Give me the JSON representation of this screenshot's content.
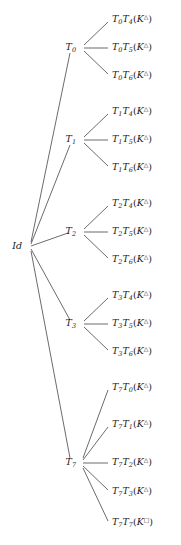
{
  "figure": {
    "type": "tree-diagram",
    "width": 181,
    "height": 545,
    "background_color": "#ffffff",
    "line_color": "#2b2b2b",
    "text_color": "#1a1a1a"
  },
  "root": {
    "id": "root",
    "label": "Id",
    "label_text": "Id",
    "x": 22,
    "y": 246
  },
  "internal_nodes": [
    {
      "id": "T0",
      "base": "T",
      "subscript": "0",
      "label_text": "T0",
      "x": 76,
      "y": 48
    },
    {
      "id": "T1",
      "base": "T",
      "subscript": "1",
      "label_text": "T1",
      "x": 76,
      "y": 140
    },
    {
      "id": "T2",
      "base": "T",
      "subscript": "2",
      "label_text": "T2",
      "x": 76,
      "y": 232
    },
    {
      "id": "T3",
      "base": "T",
      "subscript": "3",
      "label_text": "T3",
      "x": 76,
      "y": 324
    },
    {
      "id": "T7",
      "base": "T",
      "subscript": "7",
      "label_text": "T7",
      "x": 76,
      "y": 463
    }
  ],
  "leaves": [
    {
      "id": "T0T4",
      "first": "T",
      "first_sub": "0",
      "second": "T",
      "second_sub": "4",
      "k_sup": "△",
      "label_text": "T0T4(K△)",
      "parent": "T0",
      "x": 112,
      "y": 20
    },
    {
      "id": "T0T5",
      "first": "T",
      "first_sub": "0",
      "second": "T",
      "second_sub": "5",
      "k_sup": "△",
      "label_text": "T0T5(K△)",
      "parent": "T0",
      "x": 112,
      "y": 48
    },
    {
      "id": "T0T6",
      "first": "T",
      "first_sub": "0",
      "second": "T",
      "second_sub": "6",
      "k_sup": "△",
      "label_text": "T0T6(K△)",
      "parent": "T0",
      "x": 112,
      "y": 76
    },
    {
      "id": "T1T4",
      "first": "T",
      "first_sub": "1",
      "second": "T",
      "second_sub": "4",
      "k_sup": "△",
      "label_text": "T1T4(K△)",
      "parent": "T1",
      "x": 112,
      "y": 112
    },
    {
      "id": "T1T5",
      "first": "T",
      "first_sub": "1",
      "second": "T",
      "second_sub": "5",
      "k_sup": "△",
      "label_text": "T1T5(K△)",
      "parent": "T1",
      "x": 112,
      "y": 140
    },
    {
      "id": "T1T6",
      "first": "T",
      "first_sub": "1",
      "second": "T",
      "second_sub": "6",
      "k_sup": "△",
      "label_text": "T1T6(K△)",
      "parent": "T1",
      "x": 112,
      "y": 168
    },
    {
      "id": "T2T4",
      "first": "T",
      "first_sub": "2",
      "second": "T",
      "second_sub": "4",
      "k_sup": "△",
      "label_text": "T2T4(K△)",
      "parent": "T2",
      "x": 112,
      "y": 204
    },
    {
      "id": "T2T5",
      "first": "T",
      "first_sub": "2",
      "second": "T",
      "second_sub": "5",
      "k_sup": "△",
      "label_text": "T2T5(K△)",
      "parent": "T2",
      "x": 112,
      "y": 232
    },
    {
      "id": "T2T6",
      "first": "T",
      "first_sub": "2",
      "second": "T",
      "second_sub": "6",
      "k_sup": "△",
      "label_text": "T2T6(K△)",
      "parent": "T2",
      "x": 112,
      "y": 260
    },
    {
      "id": "T3T4",
      "first": "T",
      "first_sub": "3",
      "second": "T",
      "second_sub": "4",
      "k_sup": "△",
      "label_text": "T3T4(K△)",
      "parent": "T3",
      "x": 112,
      "y": 296
    },
    {
      "id": "T3T5",
      "first": "T",
      "first_sub": "3",
      "second": "T",
      "second_sub": "5",
      "k_sup": "△",
      "label_text": "T3T5(K△)",
      "parent": "T3",
      "x": 112,
      "y": 324
    },
    {
      "id": "T3T6",
      "first": "T",
      "first_sub": "3",
      "second": "T",
      "second_sub": "6",
      "k_sup": "△",
      "label_text": "T3T6(K△)",
      "parent": "T3",
      "x": 112,
      "y": 352
    },
    {
      "id": "T7T0",
      "first": "T",
      "first_sub": "7",
      "second": "T",
      "second_sub": "0",
      "k_sup": "△",
      "label_text": "T7T0(K△)",
      "parent": "T7",
      "x": 112,
      "y": 388
    },
    {
      "id": "T7T1",
      "first": "T",
      "first_sub": "7",
      "second": "T",
      "second_sub": "1",
      "k_sup": "△",
      "label_text": "T7T1(K△)",
      "parent": "T7",
      "x": 112,
      "y": 425
    },
    {
      "id": "T7T2",
      "first": "T",
      "first_sub": "7",
      "second": "T",
      "second_sub": "2",
      "k_sup": "△",
      "label_text": "T7T2(K△)",
      "parent": "T7",
      "x": 112,
      "y": 463
    },
    {
      "id": "T7T3",
      "first": "T",
      "first_sub": "7",
      "second": "T",
      "second_sub": "3",
      "k_sup": "△",
      "label_text": "T7T3(K△)",
      "parent": "T7",
      "x": 112,
      "y": 492
    },
    {
      "id": "T7T7",
      "first": "T",
      "first_sub": "7",
      "second": "T",
      "second_sub": "7",
      "k_sup": "□",
      "label_text": "T7T7(K□)",
      "parent": "T7",
      "x": 112,
      "y": 523
    }
  ],
  "edges": [
    {
      "id": "edge-root-T0",
      "from": "root",
      "to": "T0",
      "x1": 31,
      "y1": 242,
      "x2": 70,
      "y2": 53
    },
    {
      "id": "edge-root-T1",
      "from": "root",
      "to": "T1",
      "x1": 31,
      "y1": 244,
      "x2": 70,
      "y2": 145
    },
    {
      "id": "edge-root-T2",
      "from": "root",
      "to": "T2",
      "x1": 31,
      "y1": 246,
      "x2": 68,
      "y2": 233
    },
    {
      "id": "edge-root-T3",
      "from": "root",
      "to": "T3",
      "x1": 31,
      "y1": 249,
      "x2": 70,
      "y2": 320
    },
    {
      "id": "edge-root-T7",
      "from": "root",
      "to": "T7",
      "x1": 31,
      "y1": 251,
      "x2": 70,
      "y2": 458
    },
    {
      "id": "edge-T0-T0T4",
      "from": "T0",
      "to": "T0T4",
      "x1": 84,
      "y1": 45,
      "x2": 108,
      "y2": 22
    },
    {
      "id": "edge-T0-T0T5",
      "from": "T0",
      "to": "T0T5",
      "x1": 84,
      "y1": 48,
      "x2": 108,
      "y2": 48
    },
    {
      "id": "edge-T0-T0T6",
      "from": "T0",
      "to": "T0T6",
      "x1": 84,
      "y1": 51,
      "x2": 108,
      "y2": 74
    },
    {
      "id": "edge-T1-T1T4",
      "from": "T1",
      "to": "T1T4",
      "x1": 84,
      "y1": 137,
      "x2": 108,
      "y2": 114
    },
    {
      "id": "edge-T1-T1T5",
      "from": "T1",
      "to": "T1T5",
      "x1": 84,
      "y1": 140,
      "x2": 108,
      "y2": 140
    },
    {
      "id": "edge-T1-T1T6",
      "from": "T1",
      "to": "T1T6",
      "x1": 84,
      "y1": 143,
      "x2": 108,
      "y2": 166
    },
    {
      "id": "edge-T2-T2T4",
      "from": "T2",
      "to": "T2T4",
      "x1": 84,
      "y1": 229,
      "x2": 108,
      "y2": 206
    },
    {
      "id": "edge-T2-T2T5",
      "from": "T2",
      "to": "T2T5",
      "x1": 84,
      "y1": 232,
      "x2": 108,
      "y2": 232
    },
    {
      "id": "edge-T2-T2T6",
      "from": "T2",
      "to": "T2T6",
      "x1": 84,
      "y1": 235,
      "x2": 108,
      "y2": 258
    },
    {
      "id": "edge-T3-T3T4",
      "from": "T3",
      "to": "T3T4",
      "x1": 84,
      "y1": 321,
      "x2": 108,
      "y2": 298
    },
    {
      "id": "edge-T3-T3T5",
      "from": "T3",
      "to": "T3T5",
      "x1": 84,
      "y1": 324,
      "x2": 108,
      "y2": 324
    },
    {
      "id": "edge-T3-T3T6",
      "from": "T3",
      "to": "T3T6",
      "x1": 84,
      "y1": 327,
      "x2": 108,
      "y2": 350
    },
    {
      "id": "edge-T7-T7T0",
      "from": "T7",
      "to": "T7T0",
      "x1": 83,
      "y1": 458,
      "x2": 108,
      "y2": 390
    },
    {
      "id": "edge-T7-T7T1",
      "from": "T7",
      "to": "T7T1",
      "x1": 83,
      "y1": 460,
      "x2": 108,
      "y2": 427
    },
    {
      "id": "edge-T7-T7T2",
      "from": "T7",
      "to": "T7T2",
      "x1": 83,
      "y1": 463,
      "x2": 108,
      "y2": 463
    },
    {
      "id": "edge-T7-T7T3",
      "from": "T7",
      "to": "T7T3",
      "x1": 83,
      "y1": 466,
      "x2": 108,
      "y2": 490
    },
    {
      "id": "edge-T7-T7T7",
      "from": "T7",
      "to": "T7T7",
      "x1": 83,
      "y1": 468,
      "x2": 108,
      "y2": 521
    }
  ]
}
